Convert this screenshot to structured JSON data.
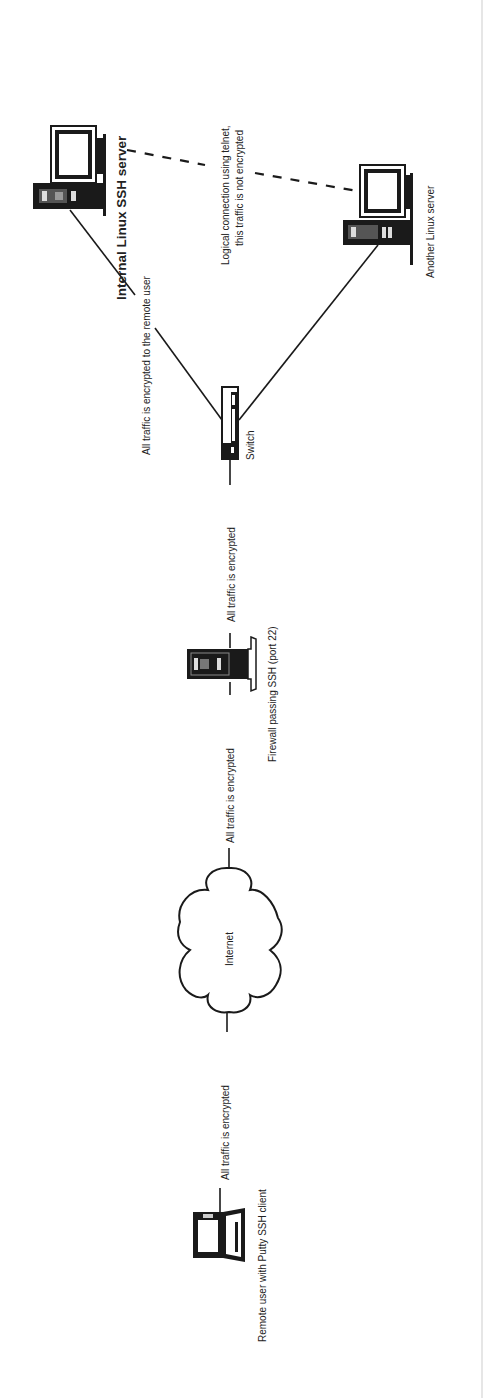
{
  "diagram": {
    "orientation": "rotated-90-ccw",
    "colors": {
      "ink": "#1a1a1a",
      "text": "#222222",
      "background": "#ffffff"
    },
    "nodes": {
      "internal_server": {
        "label": "Internal Linux SSH server",
        "icon": "desktop-computer-icon"
      },
      "another_server": {
        "label": "Another Linux server",
        "icon": "desktop-computer-icon"
      },
      "switch": {
        "label": "Switch",
        "icon": "network-switch-icon"
      },
      "firewall": {
        "label": "Firewall passing SSH (port 22)",
        "icon": "firewall-icon"
      },
      "internet": {
        "label": "Internet",
        "icon": "cloud-icon"
      },
      "remote_user": {
        "label": "Remote user with Putty SSH client",
        "icon": "laptop-icon"
      }
    },
    "edges": {
      "switch_to_internal": {
        "label": "All traffic is encrypted to the remote user",
        "style": "solid"
      },
      "internal_to_another": {
        "label_line1": "Logical connection using telnet,",
        "label_line2": "this traffic is not encrypted",
        "style": "dashed"
      },
      "switch_to_another": {
        "label": "",
        "style": "solid"
      },
      "firewall_to_switch": {
        "label": "All traffic is encrypted",
        "style": "solid"
      },
      "internet_to_firewall": {
        "label": "All traffic is encrypted",
        "style": "solid"
      },
      "laptop_to_internet": {
        "label": "All traffic is encrypted",
        "style": "solid"
      }
    }
  }
}
